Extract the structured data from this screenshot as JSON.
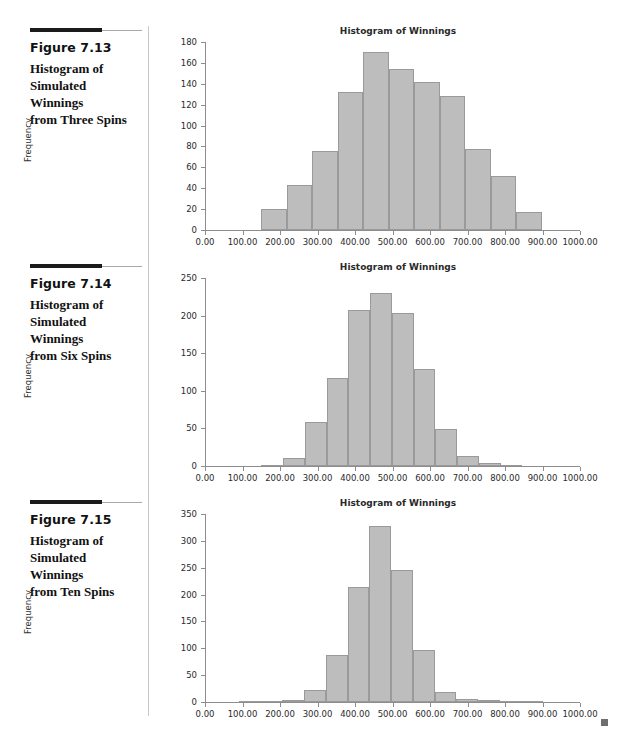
{
  "page": {
    "end_mark": "square-marker"
  },
  "figures": [
    {
      "id": "fig-7-13",
      "number": "Figure 7.13",
      "caption": "Histogram of Simulated Winnings from Three Spins",
      "caption_lines": [
        "Histogram of",
        "Simulated Winnings",
        "from Three Spins"
      ],
      "chart_data": {
        "type": "bar",
        "title": "Histogram of Winnings",
        "xlabel": "",
        "ylabel": "Frequency",
        "xlim": [
          0,
          1000
        ],
        "ylim": [
          0,
          180
        ],
        "ytick_step": 20,
        "xtick_step": 100,
        "xticks": [
          "0.00",
          "100.00",
          "200.00",
          "300.00",
          "400.00",
          "500.00",
          "600.00",
          "700.00",
          "800.00",
          "900.00",
          "1000.00"
        ],
        "yticks": [
          "0",
          "20",
          "40",
          "60",
          "80",
          "100",
          "120",
          "140",
          "160",
          "180"
        ],
        "grid": false,
        "legend": "none",
        "bin_width": 68,
        "bin_start": 150,
        "bin_edges": [
          150,
          218,
          286,
          354,
          422,
          490,
          558,
          626,
          694,
          762,
          830,
          898
        ],
        "categories": [
          "150-218",
          "218-286",
          "286-354",
          "354-422",
          "422-490",
          "490-558",
          "558-626",
          "626-694",
          "694-762",
          "762-830",
          "830-898"
        ],
        "values": [
          20,
          43,
          76,
          132,
          170,
          154,
          142,
          128,
          78,
          52,
          17
        ]
      }
    },
    {
      "id": "fig-7-14",
      "number": "Figure 7.14",
      "caption": "Histogram of Simulated Winnings from Six Spins",
      "caption_lines": [
        "Histogram of",
        "Simulated Winnings",
        "from Six Spins"
      ],
      "chart_data": {
        "type": "bar",
        "title": "Histogram of Winnings",
        "xlabel": "",
        "ylabel": "Frequency",
        "xlim": [
          0,
          1000
        ],
        "ylim": [
          0,
          250
        ],
        "ytick_step": 50,
        "xtick_step": 100,
        "xticks": [
          "0.00",
          "100.00",
          "200.00",
          "300.00",
          "400.00",
          "500.00",
          "600.00",
          "700.00",
          "800.00",
          "900.00",
          "1000.00"
        ],
        "yticks": [
          "0",
          "50",
          "100",
          "150",
          "200",
          "250"
        ],
        "grid": false,
        "legend": "none",
        "bin_width": 58,
        "bin_start": 150,
        "bin_edges": [
          150,
          208,
          266,
          324,
          382,
          440,
          498,
          556,
          614,
          672,
          730,
          788,
          846
        ],
        "categories": [
          "150-208",
          "208-266",
          "266-324",
          "324-382",
          "382-440",
          "440-498",
          "498-556",
          "556-614",
          "614-672",
          "672-730",
          "730-788",
          "788-846"
        ],
        "values": [
          1,
          11,
          58,
          117,
          208,
          230,
          204,
          129,
          49,
          13,
          4,
          1
        ]
      }
    },
    {
      "id": "fig-7-15",
      "number": "Figure 7.15",
      "caption": "Histogram of Simulated Winnings from Ten Spins",
      "caption_lines": [
        "Histogram of",
        "Simulated Winnings",
        "from Ten Spins"
      ],
      "chart_data": {
        "type": "bar",
        "title": "Histogram of Winnings",
        "xlabel": "",
        "ylabel": "Frequency",
        "xlim": [
          0,
          1000
        ],
        "ylim": [
          0,
          350
        ],
        "ytick_step": 50,
        "xtick_step": 100,
        "xticks": [
          "0.00",
          "100.00",
          "200.00",
          "300.00",
          "400.00",
          "500.00",
          "600.00",
          "700.00",
          "800.00",
          "900.00",
          "1000.00"
        ],
        "yticks": [
          "0",
          "50",
          "100",
          "150",
          "200",
          "250",
          "300",
          "350"
        ],
        "grid": false,
        "legend": "none",
        "bin_width": 58,
        "bin_start": 90,
        "bin_edges": [
          90,
          148,
          206,
          264,
          322,
          380,
          438,
          496,
          554,
          612,
          670,
          728,
          786,
          844,
          902
        ],
        "categories": [
          "90-148",
          "148-206",
          "206-264",
          "264-322",
          "322-380",
          "380-438",
          "438-496",
          "496-554",
          "554-612",
          "612-670",
          "670-728",
          "728-786",
          "786-844",
          "844-902"
        ],
        "values": [
          2,
          2,
          3,
          22,
          88,
          214,
          328,
          245,
          96,
          19,
          5,
          3,
          2,
          1
        ]
      }
    }
  ]
}
